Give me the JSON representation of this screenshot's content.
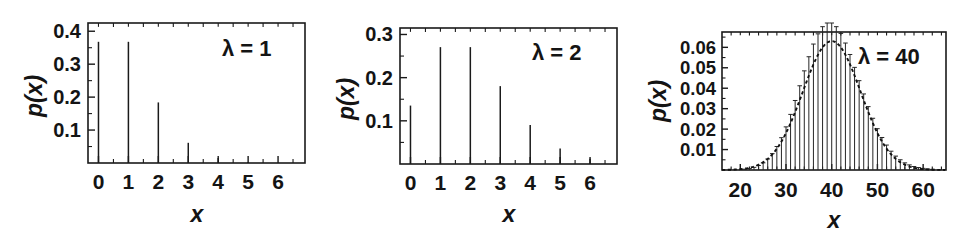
{
  "figure": {
    "name": "poisson-distribution-panels",
    "background_color": "#ffffff",
    "ink_color": "#141414",
    "panel_count": 3
  },
  "chart_data": [
    {
      "id": "lambda-1",
      "type": "bar",
      "title": "",
      "annotation": "λ = 1",
      "annotation_symbol": "λ",
      "annotation_equals": "=",
      "annotation_value": "1",
      "xlabel": "x",
      "ylabel": "p(x)",
      "xlim": [
        -0.35,
        6.9
      ],
      "ylim": [
        0,
        0.425
      ],
      "grid": false,
      "legend": "none",
      "xticks": [
        0,
        1,
        2,
        3,
        4,
        5,
        6
      ],
      "xtick_labels": [
        "0",
        "1",
        "2",
        "3",
        "4",
        "5",
        "6"
      ],
      "yticks": [
        0.1,
        0.2,
        0.3,
        0.4
      ],
      "ytick_labels": [
        "0.1",
        "0.2",
        "0.3",
        "0.4"
      ],
      "categories": [
        0,
        1,
        2,
        3,
        4,
        5,
        6
      ],
      "values": [
        0.3679,
        0.3679,
        0.1839,
        0.0613,
        0.0153,
        0.0031,
        0.0005
      ]
    },
    {
      "id": "lambda-2",
      "type": "bar",
      "title": "",
      "annotation": "λ = 2",
      "annotation_symbol": "λ",
      "annotation_equals": "=",
      "annotation_value": "2",
      "xlabel": "x",
      "ylabel": "p(x)",
      "xlim": [
        -0.35,
        6.9
      ],
      "ylim": [
        0,
        0.315
      ],
      "grid": false,
      "legend": "none",
      "xticks": [
        0,
        1,
        2,
        3,
        4,
        5,
        6
      ],
      "xtick_labels": [
        "0",
        "1",
        "2",
        "3",
        "4",
        "5",
        "6"
      ],
      "yticks": [
        0.1,
        0.2,
        0.3
      ],
      "ytick_labels": [
        "0.1",
        "0.2",
        "0.3"
      ],
      "categories": [
        0,
        1,
        2,
        3,
        4,
        5,
        6
      ],
      "values": [
        0.1353,
        0.2707,
        0.2707,
        0.1804,
        0.0902,
        0.0361,
        0.012
      ]
    },
    {
      "id": "lambda-40",
      "type": "bar",
      "title": "",
      "annotation": "λ = 40",
      "annotation_symbol": "λ",
      "annotation_equals": "=",
      "annotation_value": "40",
      "xlabel": "x",
      "ylabel": "p(x)",
      "xlim": [
        16,
        65
      ],
      "ylim": [
        0,
        0.0675
      ],
      "grid": false,
      "legend": "none",
      "overlay": "gaussian-envelope-dashed",
      "xticks": [
        20,
        30,
        40,
        50,
        60
      ],
      "xtick_labels": [
        "20",
        "30",
        "40",
        "50",
        "60"
      ],
      "yticks": [
        0.01,
        0.02,
        0.03,
        0.04,
        0.05,
        0.06
      ],
      "ytick_labels": [
        "0.01",
        "0.02",
        "0.03",
        "0.04",
        "0.05",
        "0.06"
      ],
      "categories": [
        17,
        18,
        19,
        20,
        21,
        22,
        23,
        24,
        25,
        26,
        27,
        28,
        29,
        30,
        31,
        32,
        33,
        34,
        35,
        36,
        37,
        38,
        39,
        40,
        41,
        42,
        43,
        44,
        45,
        46,
        47,
        48,
        49,
        50,
        51,
        52,
        53,
        54,
        55,
        56,
        57,
        58,
        59,
        60,
        61,
        62,
        63,
        64
      ],
      "values": [
        0.0,
        0.0001,
        0.0001,
        0.0002,
        0.0004,
        0.0007,
        0.0013,
        0.0022,
        0.0035,
        0.0054,
        0.008,
        0.0115,
        0.0158,
        0.0211,
        0.0272,
        0.034,
        0.0412,
        0.0485,
        0.0554,
        0.0616,
        0.0666,
        0.0701,
        0.0719,
        0.0719,
        0.0701,
        0.0668,
        0.0621,
        0.0565,
        0.0502,
        0.0437,
        0.0372,
        0.031,
        0.0253,
        0.0202,
        0.0159,
        0.0122,
        0.0092,
        0.0068,
        0.005,
        0.0035,
        0.0025,
        0.0017,
        0.0012,
        0.0008,
        0.0005,
        0.0003,
        0.0002,
        0.0001
      ]
    }
  ]
}
